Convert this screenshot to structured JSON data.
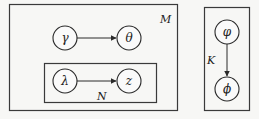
{
  "diagram": {
    "type": "plate-notation graphical model",
    "plates": [
      {
        "id": "M",
        "label": "M"
      },
      {
        "id": "N",
        "label": "N",
        "parent": "M"
      },
      {
        "id": "K",
        "label": "K"
      }
    ],
    "nodes": [
      {
        "id": "gamma",
        "label": "γ",
        "plate": "M"
      },
      {
        "id": "theta",
        "label": "θ",
        "plate": "M"
      },
      {
        "id": "lambda",
        "label": "λ",
        "plate": "N"
      },
      {
        "id": "z",
        "label": "z",
        "plate": "N"
      },
      {
        "id": "varphi",
        "label": "φ",
        "plate": "K"
      },
      {
        "id": "phi",
        "label": "ϕ",
        "plate": "K"
      }
    ],
    "edges": [
      {
        "from": "gamma",
        "to": "theta"
      },
      {
        "from": "lambda",
        "to": "z"
      },
      {
        "from": "varphi",
        "to": "phi"
      }
    ]
  }
}
